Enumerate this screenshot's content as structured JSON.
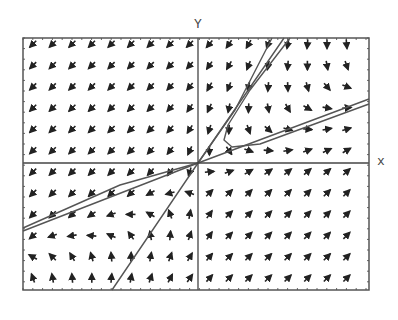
{
  "figure": {
    "type": "direction_field_phase_portrait",
    "axis_labels": {
      "x": "x",
      "y": "Y"
    },
    "frame": {
      "left": 23,
      "top": 38,
      "right": 369,
      "bottom": 290
    },
    "origin_px": {
      "x": 198,
      "y": 163
    },
    "colors": {
      "frame": "#555555",
      "arrow": "#222222",
      "trajectory": "#555555",
      "axis": "#444444",
      "background": "#ffffff"
    }
  },
  "field": {
    "cols": 17,
    "rows": 12,
    "x0": 33,
    "y0": 44,
    "dx": 19.6,
    "dy": 21.3,
    "note": "angles in degrees, math convention (0=east, 90=north)",
    "angles": [
      [
        225,
        225,
        225,
        225,
        225,
        225,
        225,
        225,
        225,
        230,
        235,
        240,
        250,
        260,
        265,
        270,
        275
      ],
      [
        225,
        225,
        225,
        225,
        225,
        225,
        225,
        225,
        228,
        235,
        240,
        248,
        258,
        265,
        270,
        280,
        290
      ],
      [
        225,
        225,
        225,
        225,
        225,
        225,
        225,
        228,
        232,
        240,
        248,
        258,
        265,
        272,
        285,
        310,
        340
      ],
      [
        225,
        225,
        225,
        225,
        225,
        225,
        225,
        228,
        235,
        245,
        258,
        268,
        280,
        300,
        330,
        350,
        5
      ],
      [
        225,
        225,
        225,
        225,
        225,
        225,
        225,
        230,
        238,
        252,
        268,
        290,
        320,
        345,
        355,
        10,
        15
      ],
      [
        225,
        225,
        225,
        225,
        225,
        225,
        228,
        232,
        245,
        270,
        305,
        340,
        355,
        10,
        20,
        25,
        30
      ],
      [
        225,
        225,
        225,
        225,
        225,
        225,
        228,
        235,
        255,
        5,
        20,
        30,
        35,
        38,
        40,
        40,
        42
      ],
      [
        225,
        225,
        225,
        225,
        225,
        222,
        210,
        195,
        160,
        45,
        45,
        45,
        45,
        45,
        45,
        45,
        45
      ],
      [
        225,
        225,
        222,
        215,
        200,
        180,
        150,
        110,
        80,
        55,
        45,
        45,
        45,
        45,
        45,
        45,
        45
      ],
      [
        220,
        200,
        190,
        175,
        155,
        125,
        100,
        85,
        70,
        55,
        45,
        45,
        45,
        45,
        45,
        45,
        45
      ],
      [
        150,
        135,
        120,
        105,
        95,
        88,
        80,
        70,
        60,
        50,
        45,
        45,
        45,
        45,
        45,
        45,
        45
      ],
      [
        110,
        100,
        95,
        90,
        85,
        80,
        72,
        62,
        55,
        48,
        45,
        45,
        45,
        45,
        45,
        45,
        45
      ]
    ]
  },
  "trajectories": [
    {
      "name": "eigenline-shallow",
      "points": [
        [
          23,
          231
        ],
        [
          198,
          163
        ],
        [
          369,
          99
        ]
      ]
    },
    {
      "name": "eigenline-steep",
      "points": [
        [
          112,
          290
        ],
        [
          198,
          163
        ],
        [
          284,
          38
        ]
      ]
    },
    {
      "name": "trajectory-upper",
      "points": [
        [
          198,
          163
        ],
        [
          235,
          110
        ],
        [
          272,
          38
        ]
      ]
    },
    {
      "name": "trajectory-hook",
      "points": [
        [
          290,
          38
        ],
        [
          250,
          90
        ],
        [
          228,
          125
        ],
        [
          224,
          140
        ],
        [
          232,
          147
        ],
        [
          260,
          144
        ],
        [
          369,
          104
        ]
      ]
    },
    {
      "name": "trajectory-left",
      "points": [
        [
          198,
          163
        ],
        [
          120,
          185
        ],
        [
          23,
          228
        ]
      ]
    }
  ]
}
